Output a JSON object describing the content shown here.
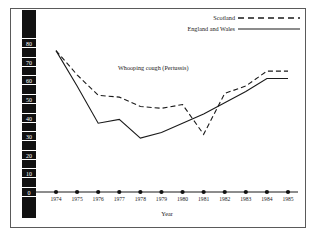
{
  "chart_data": {
    "type": "line",
    "title": "",
    "annotation": "Whooping cough (Pertussis)",
    "xlabel": "Year",
    "ylabel": "Percentage of children immunised by end of second calendar year after year of birth",
    "categories": [
      "1974",
      "1975",
      "1976",
      "1977",
      "1978",
      "1979",
      "1980",
      "1981",
      "1982",
      "1983",
      "1984",
      "1985"
    ],
    "yticks": [
      "0",
      "10",
      "20",
      "30",
      "40",
      "50",
      "60",
      "70",
      "80"
    ],
    "ylim": [
      0,
      85
    ],
    "grid": false,
    "legend_position": "top-right",
    "series": [
      {
        "name": "Scotland",
        "style": "dashed",
        "color": "#1a1a1a",
        "values": [
          76,
          63,
          52,
          51,
          46,
          45,
          47,
          31,
          53,
          57,
          65,
          65
        ]
      },
      {
        "name": "England and Wales",
        "style": "solid",
        "color": "#1a1a1a",
        "values": [
          76,
          57,
          37,
          39,
          29,
          32,
          37,
          42,
          48,
          54,
          61,
          61
        ]
      }
    ]
  }
}
